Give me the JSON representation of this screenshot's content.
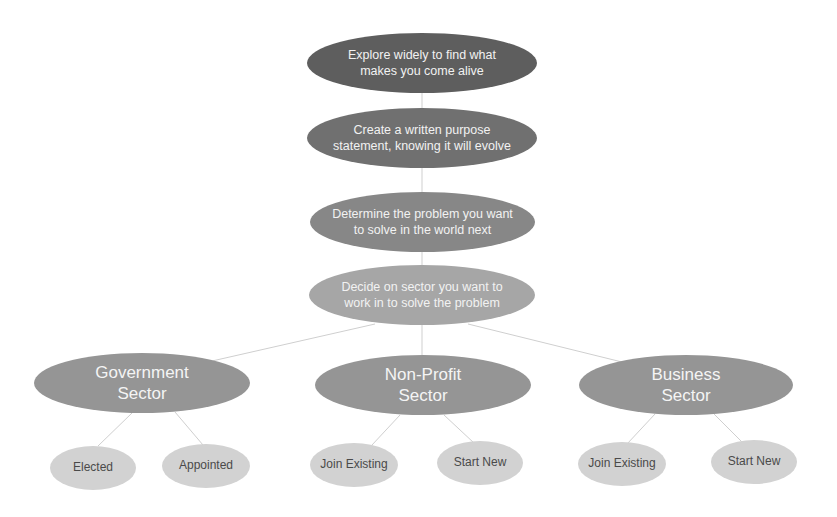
{
  "diagram": {
    "type": "hierarchy",
    "colors": {
      "step1": "#5e5e5e",
      "step2": "#707070",
      "step3": "#878787",
      "step4": "#a6a6a6",
      "sector": "#959595",
      "leaf": "#d2d2d2",
      "connector": "#cfcfcf"
    },
    "steps": [
      {
        "label": "Explore widely to find what makes you come alive"
      },
      {
        "label": "Create a written purpose statement, knowing it will evolve"
      },
      {
        "label": "Determine the problem you want to solve in the world next"
      },
      {
        "label": "Decide on sector you want to work in to solve the problem"
      }
    ],
    "sectors": [
      {
        "label": "Government Sector",
        "children": [
          {
            "label": "Elected"
          },
          {
            "label": "Appointed"
          }
        ]
      },
      {
        "label": "Non-Profit Sector",
        "children": [
          {
            "label": "Join Existing"
          },
          {
            "label": "Start New"
          }
        ]
      },
      {
        "label": "Business Sector",
        "children": [
          {
            "label": "Join Existing"
          },
          {
            "label": "Start New"
          }
        ]
      }
    ]
  }
}
